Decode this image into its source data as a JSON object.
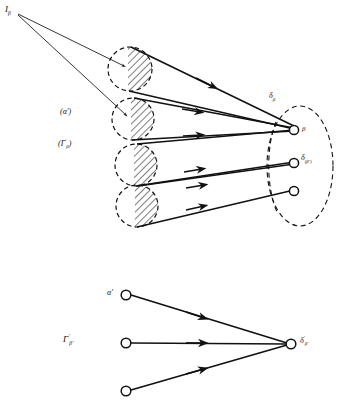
{
  "figure": {
    "type": "diagram",
    "title_visible": false,
    "background_color": "#ffffff",
    "ink_color": "#111111",
    "width": 349,
    "height": 405,
    "upper_panel": {
      "source_label": "I",
      "source_label_sub": "β",
      "cone_group_label": "(Γ",
      "cone_group_label_sup": "′",
      "cone_group_label_sub": "β",
      "cone_group_label_close": ")",
      "alpha_prime_label": "(α′)",
      "delta_beta_label": "δ",
      "delta_beta_sub": "β",
      "delta_beta_prime_label": "δ",
      "delta_beta_prime_sub": "(β′)",
      "target_node_label": "β",
      "cone_count": 4,
      "target_node_count": 3,
      "edge_count": 6,
      "thin_source_ray_count": 2
    },
    "lower_panel": {
      "alpha_prime_label": "α′",
      "gamma_label": "Γ",
      "gamma_sup": "′",
      "gamma_sub": "β′",
      "delta_label": "δ",
      "delta_sup": "′",
      "delta_sub": "β′",
      "source_node_count": 3,
      "target_node_count": 1,
      "edge_count": 3
    }
  }
}
